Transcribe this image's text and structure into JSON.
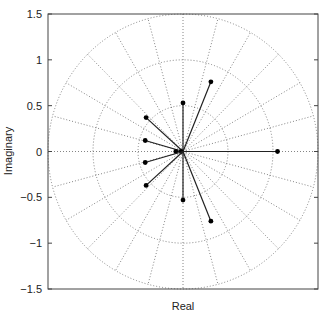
{
  "chart_data": {
    "type": "scatter",
    "subtype": "complex-plane vectors (compass/polar plot)",
    "title": "",
    "xlabel": "Real",
    "ylabel": "Imaginary",
    "xlim": [
      -1.5,
      1.5
    ],
    "ylim": [
      -1.5,
      1.5
    ],
    "y_ticks": [
      1.5,
      1,
      0.5,
      0,
      -0.5,
      -1,
      -1.5
    ],
    "y_tick_labels": [
      "1.5",
      "1",
      "0.5",
      "0",
      "−0.5",
      "−1",
      "−1.5"
    ],
    "x_ticks": [],
    "grid": {
      "type": "polar",
      "circle_radii": [
        0.5,
        1.0,
        1.5
      ],
      "ray_spacing_deg": 15,
      "style": "dotted"
    },
    "legend": null,
    "points": [
      {
        "re": 0.31,
        "im": 0.76
      },
      {
        "re": 0.0,
        "im": 0.53
      },
      {
        "re": -0.41,
        "im": 0.37
      },
      {
        "re": -0.42,
        "im": 0.12
      },
      {
        "re": -0.08,
        "im": 0.0
      },
      {
        "re": -0.02,
        "im": 0.0
      },
      {
        "re": 1.05,
        "im": 0.0
      },
      {
        "re": -0.42,
        "im": -0.12
      },
      {
        "re": -0.41,
        "im": -0.37
      },
      {
        "re": 0.0,
        "im": -0.53
      },
      {
        "re": 0.31,
        "im": -0.76
      }
    ],
    "vectors_from_origin": true
  },
  "colors": {
    "axes": "#444444",
    "grid": "#666666",
    "vector": "#222222",
    "marker": "#000000"
  }
}
